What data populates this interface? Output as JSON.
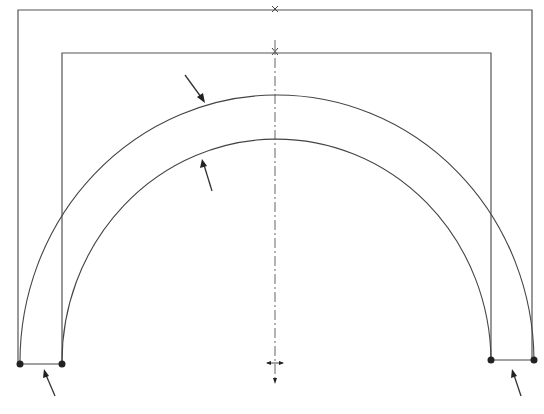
{
  "drawing": {
    "title": "",
    "description": "Semicircular arch with outer and inner rectangular frame outlines and a vertical dash-dot centerline",
    "colors": {
      "background": "#ffffff",
      "line": "#444444",
      "arrow": "#222222"
    },
    "outer_frame": {
      "left": 18,
      "top": 10,
      "right": 532,
      "bottom": 362
    },
    "inner_frame": {
      "left": 62,
      "top": 53,
      "right": 491,
      "bottom": 362
    },
    "centerline_x": 275,
    "outer_arc": {
      "start": [
        20,
        364
      ],
      "end": [
        534,
        360
      ],
      "apex_y": 97
    },
    "inner_arc": {
      "start": [
        62,
        364
      ],
      "end": [
        491,
        360
      ],
      "apex_y": 141
    },
    "nodes": [
      {
        "name": "outer-left-support",
        "x": 20,
        "y": 364
      },
      {
        "name": "inner-left-support",
        "x": 62,
        "y": 364
      },
      {
        "name": "inner-right-support",
        "x": 491,
        "y": 360
      },
      {
        "name": "outer-right-support",
        "x": 534,
        "y": 360
      }
    ],
    "arrows": [
      {
        "name": "arrow-outer-arc",
        "from": [
          185,
          75
        ],
        "to": [
          205,
          103
        ]
      },
      {
        "name": "arrow-inner-arc",
        "from": [
          212,
          191
        ],
        "to": [
          202,
          159
        ]
      },
      {
        "name": "arrow-left-span",
        "from": [
          55,
          396
        ],
        "to": [
          44,
          369
        ]
      },
      {
        "name": "arrow-right-span",
        "from": [
          521,
          396
        ],
        "to": [
          512,
          369
        ]
      }
    ],
    "labels": []
  }
}
